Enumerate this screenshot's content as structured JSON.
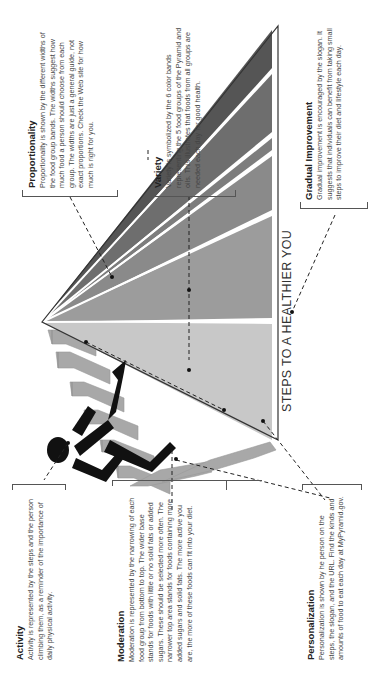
{
  "orientation": "rotated -90deg (text reads bottom-to-top)",
  "slogan": "STEPS TO A HEALTHIER YOU",
  "notes": {
    "proportionality": {
      "heading": "Proportionality",
      "body": "Proportionality is shown by the different widths of the food group bands. The widths suggest how much food a person should choose from each group. The widths are just a general guide, not exact proportions. Check the Web site for how much is right for you."
    },
    "variety": {
      "heading": "Variety",
      "body": "Variety is symbolized by the 6 color bands representing the 5 food groups of the Pyramid and oils. This illustrates that foods from all groups are needed each day for good health."
    },
    "gradual_improvement": {
      "heading": "Gradual Improvement",
      "body": "Gradual improvement is encouraged by the slogan. It suggests that individuals can benefit from taking small steps to improve their diet and lifestyle each day."
    },
    "activity": {
      "heading": "Activity",
      "body": "Activity is represented by the steps and the person climbing them, as a reminder of the importance of daily physical activity."
    },
    "moderation": {
      "heading": "Moderation",
      "body": "Moderation is represented by the narrowing of each food group from bottom to top. The wider base stands for foods with little or no solid fats or added sugars. These should be selected more often. The narrower top area stands for foods containing more added sugars and solid fats. The more active you are, the more of these foods can fit into your diet."
    },
    "personalization": {
      "heading": "Personalization",
      "body": "Personalization is shown by he person on the steps, the slogan, and the URL. Find the kinds and amounts of food to eat each day at MyPyramid.gov."
    }
  },
  "pyramid": {
    "band_count": 6,
    "band_colors": [
      "#555555",
      "#6e6e6e",
      "#8a8a8a",
      "#9c9c9c",
      "#b0b0b0",
      "#cdcdcd"
    ],
    "outline_color": "#333333",
    "step_color": "#a8a8a8",
    "figure_color": "#111111"
  }
}
